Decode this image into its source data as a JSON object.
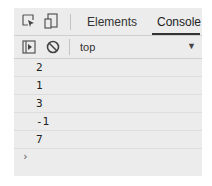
{
  "tabbar": {
    "tabs": [
      {
        "label": "Elements",
        "active": false
      },
      {
        "label": "Console",
        "active": true
      }
    ],
    "icons": [
      "inspect-element-icon",
      "device-toolbar-icon"
    ]
  },
  "toolbar": {
    "icons": [
      "sidebar-toggle-icon",
      "clear-console-icon"
    ],
    "context_label": "top",
    "dropdown_icon": "dropdown-arrow-icon"
  },
  "console": {
    "outputs": [
      "2",
      "1",
      "3",
      "-1",
      "7"
    ],
    "prompt_glyph": "›"
  },
  "colors": {
    "panel_bg": "#ececec",
    "active_tab_underline": "#333333"
  }
}
